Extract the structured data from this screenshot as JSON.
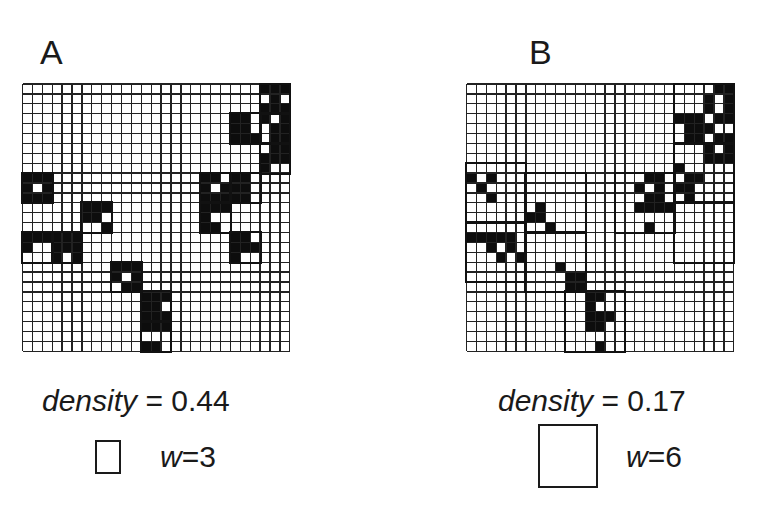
{
  "panels": [
    {
      "id": "A",
      "label": "A",
      "density_label": "density",
      "density_eq": " = 0.44",
      "density_value": 0.44,
      "window_label": "w",
      "window_eq": "=3",
      "window_size": 3,
      "grid": {
        "rows": 27,
        "cols": 27,
        "x": 22.5,
        "y": 84,
        "cell": 9.9
      },
      "boxes": [
        [
          24,
          0,
          3,
          3
        ],
        [
          24,
          3,
          3,
          3
        ],
        [
          24,
          6,
          3,
          3
        ],
        [
          21,
          3,
          3,
          3
        ],
        [
          0,
          9,
          3,
          3
        ],
        [
          18,
          9,
          3,
          3
        ],
        [
          21,
          9,
          3,
          3
        ],
        [
          18,
          12,
          3,
          3
        ],
        [
          21,
          15,
          3,
          3
        ],
        [
          6,
          12,
          3,
          3
        ],
        [
          0,
          15,
          3,
          3
        ],
        [
          3,
          15,
          3,
          3
        ],
        [
          9,
          18,
          3,
          3
        ],
        [
          12,
          21,
          3,
          3
        ],
        [
          12,
          24,
          3,
          3
        ]
      ],
      "black": [
        [
          24,
          0
        ],
        [
          25,
          0
        ],
        [
          26,
          0
        ],
        [
          25,
          1
        ],
        [
          24,
          2
        ],
        [
          26,
          2
        ],
        [
          25,
          2
        ],
        [
          26,
          3
        ],
        [
          24,
          3
        ],
        [
          25,
          4
        ],
        [
          26,
          4
        ],
        [
          25,
          5
        ],
        [
          26,
          5
        ],
        [
          26,
          6
        ],
        [
          25,
          6
        ],
        [
          24,
          7
        ],
        [
          25,
          7
        ],
        [
          26,
          7
        ],
        [
          24,
          8
        ],
        [
          21,
          3
        ],
        [
          22,
          3
        ],
        [
          21,
          4
        ],
        [
          22,
          4
        ],
        [
          21,
          5
        ],
        [
          22,
          5
        ],
        [
          23,
          5
        ],
        [
          0,
          9
        ],
        [
          1,
          9
        ],
        [
          2,
          9
        ],
        [
          0,
          10
        ],
        [
          2,
          10
        ],
        [
          1,
          11
        ],
        [
          0,
          11
        ],
        [
          2,
          11
        ],
        [
          18,
          9
        ],
        [
          19,
          9
        ],
        [
          21,
          9
        ],
        [
          22,
          9
        ],
        [
          22,
          10
        ],
        [
          18,
          10
        ],
        [
          20,
          10
        ],
        [
          21,
          10
        ],
        [
          18,
          11
        ],
        [
          19,
          11
        ],
        [
          20,
          11
        ],
        [
          21,
          11
        ],
        [
          22,
          11
        ],
        [
          18,
          12
        ],
        [
          19,
          12
        ],
        [
          20,
          12
        ],
        [
          18,
          13
        ],
        [
          18,
          14
        ],
        [
          19,
          14
        ],
        [
          21,
          15
        ],
        [
          22,
          15
        ],
        [
          22,
          16
        ],
        [
          21,
          16
        ],
        [
          21,
          17
        ],
        [
          23,
          16
        ],
        [
          6,
          12
        ],
        [
          7,
          12
        ],
        [
          8,
          12
        ],
        [
          7,
          13
        ],
        [
          6,
          13
        ],
        [
          8,
          14
        ],
        [
          0,
          15
        ],
        [
          1,
          15
        ],
        [
          2,
          15
        ],
        [
          3,
          15
        ],
        [
          4,
          15
        ],
        [
          5,
          15
        ],
        [
          0,
          16
        ],
        [
          3,
          16
        ],
        [
          4,
          16
        ],
        [
          5,
          16
        ],
        [
          3,
          17
        ],
        [
          5,
          17
        ],
        [
          9,
          18
        ],
        [
          10,
          18
        ],
        [
          11,
          18
        ],
        [
          9,
          19
        ],
        [
          11,
          19
        ],
        [
          10,
          20
        ],
        [
          11,
          20
        ],
        [
          12,
          21
        ],
        [
          13,
          21
        ],
        [
          14,
          21
        ],
        [
          12,
          22
        ],
        [
          13,
          22
        ],
        [
          12,
          23
        ],
        [
          13,
          23
        ],
        [
          14,
          23
        ],
        [
          12,
          24
        ],
        [
          13,
          24
        ],
        [
          14,
          24
        ],
        [
          13,
          26
        ],
        [
          12,
          26
        ]
      ]
    },
    {
      "id": "B",
      "label": "B",
      "density_label": "density",
      "density_eq": " = 0.17",
      "density_value": 0.17,
      "window_label": "w",
      "window_eq": "=6",
      "window_size": 6,
      "grid": {
        "rows": 27,
        "cols": 27,
        "x": 466.5,
        "y": 84,
        "cell": 9.9
      },
      "boxes": [
        [
          21,
          0,
          6,
          6
        ],
        [
          21,
          6,
          6,
          6
        ],
        [
          21,
          12,
          6,
          6
        ],
        [
          15,
          9,
          6,
          6
        ],
        [
          0,
          8,
          6,
          6
        ],
        [
          6,
          9,
          6,
          6
        ],
        [
          0,
          14,
          6,
          6
        ],
        [
          6,
          15,
          6,
          6
        ],
        [
          10,
          21,
          6,
          6
        ]
      ],
      "black": [
        [
          26,
          0
        ],
        [
          25,
          0
        ],
        [
          24,
          1
        ],
        [
          26,
          1
        ],
        [
          24,
          2
        ],
        [
          26,
          2
        ],
        [
          21,
          3
        ],
        [
          22,
          3
        ],
        [
          23,
          3
        ],
        [
          25,
          3
        ],
        [
          26,
          3
        ],
        [
          22,
          4
        ],
        [
          24,
          4
        ],
        [
          23,
          4
        ],
        [
          22,
          5
        ],
        [
          23,
          5
        ],
        [
          25,
          5
        ],
        [
          26,
          5
        ],
        [
          26,
          6
        ],
        [
          24,
          6
        ],
        [
          24,
          7
        ],
        [
          25,
          7
        ],
        [
          26,
          7
        ],
        [
          21,
          8
        ],
        [
          22,
          9
        ],
        [
          23,
          9
        ],
        [
          22,
          10
        ],
        [
          21,
          10
        ],
        [
          22,
          11
        ],
        [
          19,
          9
        ],
        [
          18,
          9
        ],
        [
          17,
          10
        ],
        [
          19,
          10
        ],
        [
          18,
          11
        ],
        [
          19,
          11
        ],
        [
          17,
          12
        ],
        [
          18,
          12
        ],
        [
          19,
          12
        ],
        [
          20,
          12
        ],
        [
          18,
          14
        ],
        [
          0,
          9
        ],
        [
          2,
          9
        ],
        [
          1,
          10
        ],
        [
          2,
          11
        ],
        [
          7,
          12
        ],
        [
          6,
          13
        ],
        [
          7,
          13
        ],
        [
          8,
          14
        ],
        [
          0,
          15
        ],
        [
          1,
          15
        ],
        [
          2,
          15
        ],
        [
          3,
          15
        ],
        [
          4,
          15
        ],
        [
          2,
          16
        ],
        [
          4,
          16
        ],
        [
          3,
          17
        ],
        [
          5,
          17
        ],
        [
          9,
          18
        ],
        [
          10,
          19
        ],
        [
          11,
          19
        ],
        [
          10,
          20
        ],
        [
          11,
          20
        ],
        [
          12,
          21
        ],
        [
          13,
          21
        ],
        [
          12,
          22
        ],
        [
          12,
          23
        ],
        [
          13,
          23
        ],
        [
          14,
          23
        ],
        [
          12,
          24
        ],
        [
          13,
          24
        ],
        [
          13,
          26
        ]
      ]
    }
  ],
  "layout": {
    "label_pos": [
      [
        40,
        35
      ],
      [
        529,
        35
      ]
    ],
    "density_pos": [
      [
        42,
        384
      ],
      [
        498,
        384
      ]
    ],
    "legend_box": [
      [
        95,
        440,
        26,
        34
      ],
      [
        538,
        424,
        60,
        64
      ]
    ],
    "legend_text_pos": [
      [
        160,
        440
      ],
      [
        626,
        440
      ]
    ]
  }
}
